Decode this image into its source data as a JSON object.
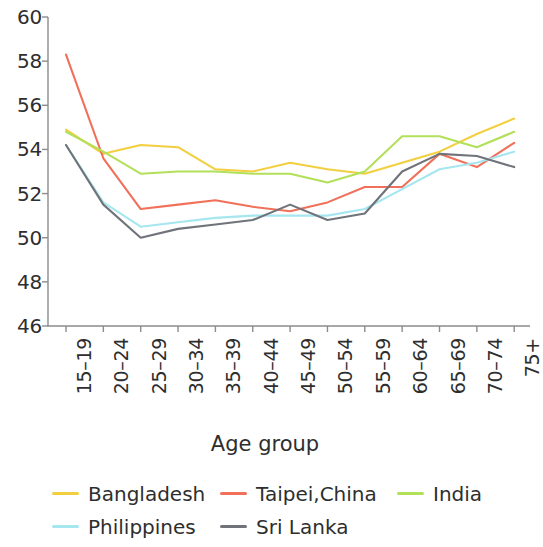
{
  "chart_data": {
    "type": "line",
    "title": "",
    "xlabel": "Age group",
    "ylabel": "",
    "categories": [
      "15–19",
      "20–24",
      "25–29",
      "30–34",
      "35–39",
      "40–44",
      "45–49",
      "50–54",
      "55–59",
      "60–64",
      "65–69",
      "70–74",
      "75+"
    ],
    "ylim": [
      46,
      60
    ],
    "yticks": [
      46,
      48,
      50,
      52,
      54,
      56,
      58,
      60
    ],
    "ytick_labels": [
      "46",
      "48",
      "50",
      "52",
      "54",
      "56",
      "58",
      "60"
    ],
    "grid": false,
    "legend_position": "bottom",
    "series": [
      {
        "name": "Bangladesh",
        "color": "#f2cf3f",
        "values": [
          54.9,
          53.8,
          54.2,
          54.1,
          53.1,
          53.0,
          53.4,
          53.1,
          52.9,
          53.4,
          53.9,
          54.7,
          55.4
        ]
      },
      {
        "name": "Taipei,China",
        "color": "#f0705a",
        "values": [
          58.3,
          53.6,
          51.3,
          51.5,
          51.7,
          51.4,
          51.2,
          51.6,
          52.3,
          52.3,
          53.8,
          53.2,
          54.3
        ]
      },
      {
        "name": "India",
        "color": "#b2e05a",
        "values": [
          54.8,
          53.9,
          52.9,
          53.0,
          53.0,
          52.9,
          52.9,
          52.5,
          53.0,
          54.6,
          54.6,
          54.1,
          54.8
        ]
      },
      {
        "name": "Philippines",
        "color": "#a5e6ef",
        "values": [
          54.2,
          51.6,
          50.5,
          50.7,
          50.9,
          51.0,
          51.0,
          51.0,
          51.3,
          52.2,
          53.1,
          53.4,
          53.9
        ]
      },
      {
        "name": "Sri Lanka",
        "color": "#70737a",
        "values": [
          54.2,
          51.5,
          50.0,
          50.4,
          50.6,
          50.8,
          51.5,
          50.8,
          51.1,
          53.0,
          53.8,
          53.7,
          53.2
        ]
      }
    ]
  },
  "legend": {
    "rows": [
      [
        {
          "label": "Bangladesh",
          "color": "#f2cf3f"
        },
        {
          "label": "Taipei,China",
          "color": "#f0705a"
        },
        {
          "label": "India",
          "color": "#b2e05a"
        }
      ],
      [
        {
          "label": "Philippines",
          "color": "#a5e6ef"
        },
        {
          "label": "Sri Lanka",
          "color": "#70737a"
        }
      ]
    ]
  },
  "axis": {
    "color": "#8c8c8c",
    "x_title": "Age group"
  }
}
